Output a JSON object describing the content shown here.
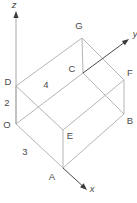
{
  "figure": {
    "type": "wireframe-box-3d-diagram",
    "canvas": {
      "width": 137,
      "height": 203,
      "background": "#ffffff"
    },
    "colors": {
      "edge": "#b5b5b5",
      "axis_shaft_dark": "#4a4a4a",
      "axis_shaft_light": "#a8a8a8",
      "arrowhead": "#3a3a3a",
      "label": "#4a4a4a"
    },
    "vertices": {
      "O": {
        "x": 16,
        "y": 124
      },
      "A": {
        "x": 63,
        "y": 168
      },
      "B": {
        "x": 124,
        "y": 114
      },
      "C": {
        "x": 83,
        "y": 73
      },
      "D": {
        "x": 16,
        "y": 86
      },
      "E": {
        "x": 63,
        "y": 130
      },
      "F": {
        "x": 124,
        "y": 80
      },
      "G": {
        "x": 82,
        "y": 38
      }
    },
    "edges": [
      [
        "O",
        "A"
      ],
      [
        "A",
        "B"
      ],
      [
        "B",
        "C"
      ],
      [
        "C",
        "O"
      ],
      [
        "D",
        "E"
      ],
      [
        "E",
        "F"
      ],
      [
        "F",
        "G"
      ],
      [
        "G",
        "D"
      ],
      [
        "O",
        "D"
      ],
      [
        "A",
        "E"
      ],
      [
        "B",
        "F"
      ],
      [
        "C",
        "G"
      ]
    ],
    "axes": [
      {
        "name": "z",
        "label": "z",
        "from": {
          "x": 16,
          "y": 124
        },
        "to": {
          "x": 16,
          "y": 11
        },
        "shaft": "light",
        "label_x": 14,
        "label_y": 8
      },
      {
        "name": "x",
        "label": "x",
        "from": {
          "x": 63,
          "y": 168
        },
        "to": {
          "x": 87,
          "y": 190
        },
        "shaft": "dark",
        "label_x": 92,
        "label_y": 192
      },
      {
        "name": "y",
        "label": "y",
        "from": {
          "x": 83,
          "y": 73
        },
        "to": {
          "x": 129,
          "y": 39
        },
        "shaft": "dark",
        "label_x": 135,
        "label_y": 37
      }
    ],
    "vertex_labels": [
      {
        "text": "O",
        "x": 7,
        "y": 128
      },
      {
        "text": "A",
        "x": 52,
        "y": 180
      },
      {
        "text": "B",
        "x": 130,
        "y": 124
      },
      {
        "text": "C",
        "x": 72,
        "y": 72
      },
      {
        "text": "D",
        "x": 8,
        "y": 85
      },
      {
        "text": "E",
        "x": 70,
        "y": 139
      },
      {
        "text": "F",
        "x": 130,
        "y": 76
      },
      {
        "text": "G",
        "x": 79,
        "y": 29
      }
    ],
    "dimension_labels": [
      {
        "text": "2",
        "x": 7,
        "y": 106,
        "edge": "O-D"
      },
      {
        "text": "3",
        "x": 25,
        "y": 155,
        "edge": "O-A"
      },
      {
        "text": "4",
        "x": 46,
        "y": 88,
        "edge": "D-G"
      }
    ]
  }
}
